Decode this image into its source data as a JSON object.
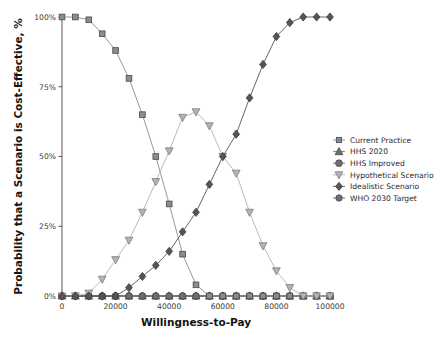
{
  "chart_data": {
    "type": "line",
    "title": "",
    "xlabel": "Willingness-to-Pay",
    "ylabel": "Probability that a Scenario is Cost-Effective, %",
    "xlim": [
      0,
      100000
    ],
    "ylim": [
      0,
      100
    ],
    "grid": false,
    "legend_position": "right",
    "xticks": [
      0,
      20000,
      40000,
      60000,
      80000,
      100000
    ],
    "xtick_labels": [
      "0",
      "20000",
      "40000",
      "60000",
      "80000",
      "100000"
    ],
    "yticks": [
      0,
      25,
      50,
      75,
      100
    ],
    "ytick_labels": [
      "0%",
      "25%",
      "50%",
      "75%",
      "100%"
    ],
    "x": [
      0,
      5000,
      10000,
      15000,
      20000,
      25000,
      30000,
      35000,
      40000,
      45000,
      50000,
      55000,
      60000,
      65000,
      70000,
      75000,
      80000,
      85000,
      90000,
      95000,
      100000
    ],
    "series": [
      {
        "name": "Current Practice",
        "marker": "square",
        "color": "#8c8c8c",
        "values": [
          100,
          100,
          99,
          94,
          88,
          78,
          65,
          50,
          33,
          15,
          4,
          0,
          0,
          0,
          0,
          0,
          0,
          0,
          0,
          0,
          0
        ]
      },
      {
        "name": "HHS 2020",
        "marker": "triangle-up",
        "color": "#6e6e6e",
        "values": [
          0,
          0,
          0,
          0,
          0,
          0,
          0,
          0,
          0,
          0,
          0,
          0,
          0,
          0,
          0,
          0,
          0,
          0,
          0,
          0,
          0
        ]
      },
      {
        "name": "HHS Improved",
        "marker": "circle",
        "color": "#6e6e6e",
        "values": [
          0,
          0,
          0,
          0,
          0,
          0,
          0,
          0,
          0,
          0,
          0,
          0,
          0,
          0,
          0,
          0,
          0,
          0,
          0,
          0,
          0
        ]
      },
      {
        "name": "Hypothetical Scenario",
        "marker": "triangle-down",
        "color": "#b3b3b3",
        "values": [
          0,
          0,
          1,
          6,
          13,
          20,
          30,
          41,
          52,
          64,
          66,
          61,
          50,
          44,
          30,
          18,
          9,
          3,
          0,
          0,
          0
        ]
      },
      {
        "name": "Idealistic Scenario",
        "marker": "diamond",
        "color": "#555555",
        "values": [
          0,
          0,
          0,
          0,
          0,
          3,
          7,
          11,
          16,
          23,
          30,
          40,
          50,
          58,
          71,
          83,
          93,
          98,
          100,
          100,
          100
        ]
      },
      {
        "name": "WHO 2030 Target",
        "marker": "circle-dash",
        "color": "#6e6e6e",
        "values": [
          0,
          0,
          0,
          0,
          0,
          0,
          0,
          0,
          0,
          0,
          0,
          0,
          0,
          0,
          0,
          0,
          0,
          0,
          0,
          0,
          0
        ]
      }
    ]
  },
  "legend": {
    "items": [
      {
        "label": "Current Practice",
        "marker": "square",
        "color": "#8c8c8c"
      },
      {
        "label": "HHS 2020",
        "marker": "triangle-up",
        "color": "#6e6e6e"
      },
      {
        "label": "HHS Improved",
        "marker": "circle",
        "color": "#6e6e6e"
      },
      {
        "label": "Hypothetical Scenario",
        "marker": "triangle-down",
        "color": "#b3b3b3"
      },
      {
        "label": "Idealistic Scenario",
        "marker": "diamond",
        "color": "#555555"
      },
      {
        "label": "WHO 2030 Target",
        "marker": "circle-dash",
        "color": "#6e6e6e"
      }
    ]
  }
}
